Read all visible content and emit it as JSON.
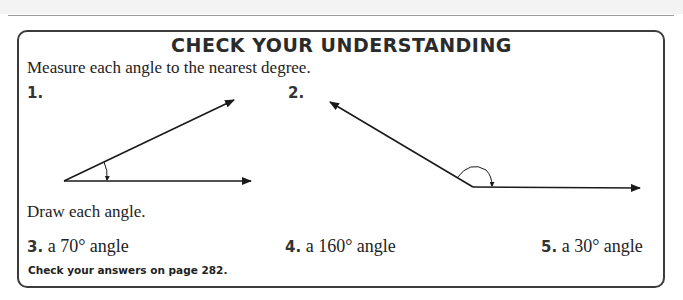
{
  "header": {
    "band": ""
  },
  "section": {
    "title": "CHECK YOUR UNDERSTANDING",
    "measure_instruction": "Measure each angle to the nearest degree.",
    "measure_items": [
      {
        "number": "1.",
        "figure": "acute angle with arc marker"
      },
      {
        "number": "2.",
        "figure": "obtuse angle with arc marker"
      }
    ],
    "draw_instruction": "Draw each angle.",
    "draw_items": [
      {
        "number": "3.",
        "text": "a 70° angle"
      },
      {
        "number": "4.",
        "text": "a 160° angle"
      },
      {
        "number": "5.",
        "text": "a 30° angle"
      }
    ],
    "footer_note": "Check your answers on page 282."
  },
  "colors": {
    "border": "#3c3c3c",
    "text": "#222222",
    "rule": "#9a9a9a"
  }
}
